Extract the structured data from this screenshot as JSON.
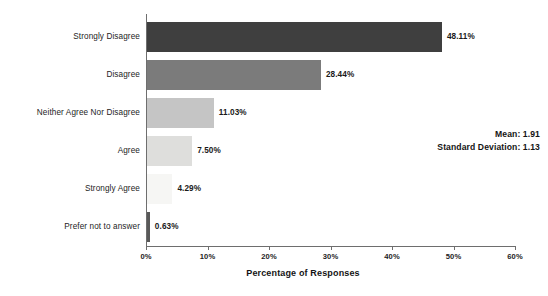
{
  "chart_data": {
    "type": "bar",
    "orientation": "horizontal",
    "title": "",
    "xlabel": "Percentage of Responses",
    "ylabel": "",
    "xlim": [
      0,
      60
    ],
    "grid": false,
    "legend": null,
    "categories": [
      "Strongly Disagree",
      "Disagree",
      "Neither Agree Nor Disagree",
      "Agree",
      "Strongly Agree",
      "Prefer not to answer"
    ],
    "values": [
      48.11,
      28.44,
      11.03,
      7.5,
      4.29,
      0.63
    ],
    "value_labels": [
      "48.11%",
      "28.44%",
      "11.03%",
      "7.50%",
      "4.29%",
      "0.63%"
    ],
    "bar_colors": [
      "#3f3f3f",
      "#7b7b7b",
      "#c5c5c5",
      "#dededc",
      "#f6f6f4",
      "#595959"
    ],
    "xticks": [
      0,
      10,
      20,
      30,
      40,
      50,
      60
    ],
    "xtick_labels": [
      "0%",
      "10%",
      "20%",
      "30%",
      "40%",
      "50%",
      "60%"
    ],
    "annotations": [
      {
        "label": "Mean: 1.91"
      },
      {
        "label": "Standard Deviation: 1.13"
      }
    ]
  },
  "stats": {
    "mean_line": "Mean: 1.91",
    "sd_line": "Standard Deviation: 1.13"
  }
}
